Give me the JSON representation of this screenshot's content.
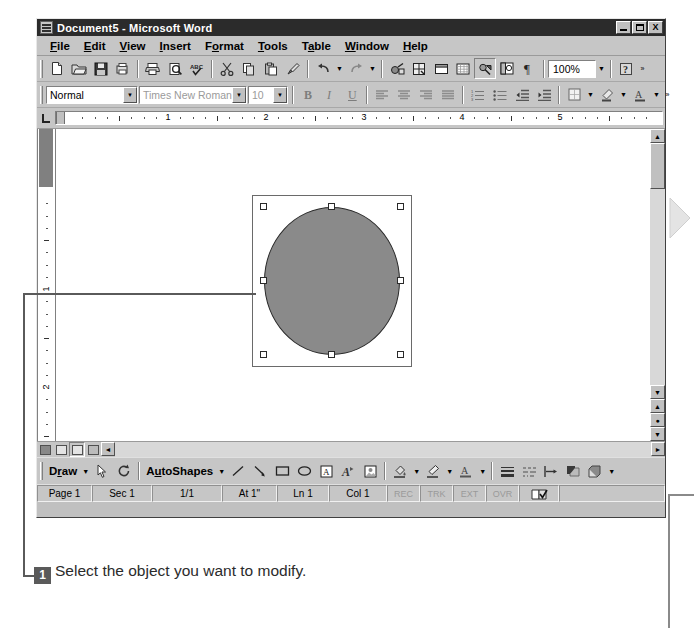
{
  "window": {
    "title": "Document5 - Microsoft Word",
    "icon": "word-document-icon",
    "controls": {
      "minimize": "_",
      "restore": "restore",
      "close": "X"
    }
  },
  "menubar": {
    "items": [
      {
        "label": "File",
        "mnemonic": "F"
      },
      {
        "label": "Edit",
        "mnemonic": "E"
      },
      {
        "label": "View",
        "mnemonic": "V"
      },
      {
        "label": "Insert",
        "mnemonic": "I"
      },
      {
        "label": "Format",
        "mnemonic": "o"
      },
      {
        "label": "Tools",
        "mnemonic": "T"
      },
      {
        "label": "Table",
        "mnemonic": "a"
      },
      {
        "label": "Window",
        "mnemonic": "W"
      },
      {
        "label": "Help",
        "mnemonic": "H"
      }
    ]
  },
  "standard_toolbar": {
    "buttons": [
      "new-document-icon",
      "open-folder-icon",
      "save-disk-icon",
      "mail-recipient-icon",
      "print-icon",
      "print-preview-icon",
      "spelling-check-icon",
      "cut-scissors-icon",
      "copy-icon",
      "paste-clipboard-icon",
      "format-painter-icon",
      "undo-icon",
      "redo-icon",
      "insert-hyperlink-icon",
      "tables-and-borders-icon",
      "insert-table-icon",
      "insert-excel-sheet-icon",
      "columns-icon",
      "drawing-icon",
      "document-map-icon",
      "show-formatting-marks-icon"
    ],
    "zoom_value": "100%",
    "help_label": "?"
  },
  "formatting_toolbar": {
    "style_value": "Normal",
    "font_value": "Times New Roman",
    "size_value": "10",
    "bold_label": "B",
    "italic_label": "I",
    "underline_label": "U",
    "buttons": [
      "align-left-icon",
      "align-center-icon",
      "align-right-icon",
      "justify-icon",
      "numbered-list-icon",
      "bulleted-list-icon",
      "decrease-indent-icon",
      "increase-indent-icon",
      "borders-icon",
      "highlight-icon",
      "font-color-icon"
    ]
  },
  "ruler": {
    "corner_label": "L",
    "horizontal_numbers": [
      "1",
      "2",
      "3",
      "4",
      "5"
    ],
    "vertical_numbers": [
      "1",
      "2"
    ]
  },
  "document": {
    "shape": {
      "type": "oval",
      "fill_color": "#8a8a8a",
      "line_color": "#2a2a2a",
      "selected": true,
      "handle_count": 8
    }
  },
  "view_buttons": [
    "normal-view-icon",
    "web-layout-view-icon",
    "print-layout-view-icon",
    "outline-view-icon"
  ],
  "drawing_toolbar": {
    "draw_label": "Draw",
    "draw_mnemonic": "r",
    "autoshapes_label": "AutoShapes",
    "autoshapes_mnemonic": "u",
    "buttons": [
      "select-objects-arrow-icon",
      "free-rotate-icon",
      "line-icon",
      "arrow-icon",
      "rectangle-icon",
      "oval-icon",
      "text-box-icon",
      "insert-wordart-icon",
      "insert-clip-art-icon",
      "fill-color-icon",
      "line-color-icon",
      "font-color-icon",
      "line-style-icon",
      "dash-style-icon",
      "arrow-style-icon",
      "shadow-icon",
      "3d-icon"
    ]
  },
  "statusbar": {
    "page": "Page 1",
    "section": "Sec 1",
    "pages": "1/1",
    "at": "At 1\"",
    "line": "Ln 1",
    "column": "Col 1",
    "flags": [
      "REC",
      "TRK",
      "EXT",
      "OVR"
    ],
    "spell_icon": "spelling-status-icon"
  },
  "annotation": {
    "step_number": "1",
    "text": "Select the object you want to modify."
  },
  "colors": {
    "window_face": "#c0c0c0",
    "titlebar": "#2b2b2b",
    "shape_fill": "#8a8a8a",
    "badge": "#5a5a5a"
  }
}
